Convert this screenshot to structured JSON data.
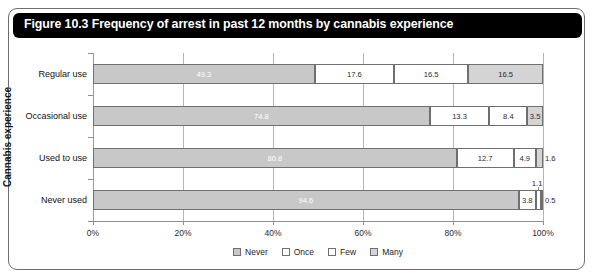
{
  "figure": {
    "title": "Figure 10.3 Frequency of arrest in past 12 months by cannabis experience"
  },
  "legend": {
    "items": [
      {
        "label": "Never",
        "color": "#c8c8c8"
      },
      {
        "label": "Once",
        "color": "#ffffff"
      },
      {
        "label": "Few",
        "color": "#ffffff"
      },
      {
        "label": "Many",
        "color": "#d4d4d4"
      }
    ]
  },
  "chart_data": {
    "type": "bar",
    "orientation": "horizontal",
    "stacked": true,
    "normalized_percent": true,
    "title": "Figure 10.3 Frequency of arrest in past 12 months by cannabis experience",
    "xlabel": "",
    "ylabel": "Cannabis experience",
    "xlim": [
      0,
      100
    ],
    "xticks": [
      0,
      20,
      40,
      60,
      80,
      100
    ],
    "xtick_labels": [
      "0%",
      "20%",
      "40%",
      "60%",
      "80%",
      "100%"
    ],
    "grid": true,
    "legend_position": "bottom",
    "categories": [
      "Regular use",
      "Occasional use",
      "Used to use",
      "Never used"
    ],
    "series": [
      {
        "name": "Never",
        "values": [
          49.3,
          74.8,
          80.8,
          94.6
        ]
      },
      {
        "name": "Once",
        "values": [
          17.6,
          13.3,
          12.7,
          3.8
        ]
      },
      {
        "name": "Few",
        "values": [
          16.5,
          8.4,
          4.9,
          1.1
        ]
      },
      {
        "name": "Many",
        "values": [
          16.5,
          3.5,
          1.6,
          0.5
        ]
      }
    ]
  },
  "bars": [
    {
      "category": "Regular use",
      "segments": [
        {
          "series": "Never",
          "value": "49.3",
          "start": 0,
          "size": 49.3,
          "style": "never",
          "label_inside": true
        },
        {
          "series": "Once",
          "value": "17.6",
          "start": 49.3,
          "size": 17.6,
          "style": "once",
          "label_inside": true
        },
        {
          "series": "Few",
          "value": "16.5",
          "start": 66.9,
          "size": 16.5,
          "style": "few",
          "label_inside": true
        },
        {
          "series": "Many",
          "value": "16.5",
          "start": 83.4,
          "size": 16.6,
          "style": "many",
          "label_inside": true
        }
      ]
    },
    {
      "category": "Occasional use",
      "segments": [
        {
          "series": "Never",
          "value": "74.8",
          "start": 0,
          "size": 74.8,
          "style": "never",
          "label_inside": true
        },
        {
          "series": "Once",
          "value": "13.3",
          "start": 74.8,
          "size": 13.3,
          "style": "once",
          "label_inside": true
        },
        {
          "series": "Few",
          "value": "8.4",
          "start": 88.1,
          "size": 8.4,
          "style": "few",
          "label_inside": true
        },
        {
          "series": "Many",
          "value": "3.5",
          "start": 96.5,
          "size": 3.5,
          "style": "many",
          "label_inside": true
        }
      ]
    },
    {
      "category": "Used to use",
      "segments": [
        {
          "series": "Never",
          "value": "80.8",
          "start": 0,
          "size": 80.8,
          "style": "never",
          "label_inside": true
        },
        {
          "series": "Once",
          "value": "12.7",
          "start": 80.8,
          "size": 12.7,
          "style": "once",
          "label_inside": true
        },
        {
          "series": "Few",
          "value": "4.9",
          "start": 93.5,
          "size": 4.9,
          "style": "few",
          "label_inside": true
        },
        {
          "series": "Many",
          "value": "1.6",
          "start": 98.4,
          "size": 1.6,
          "style": "many",
          "label_inside": false,
          "label_offset": 2
        }
      ]
    },
    {
      "category": "Never used",
      "segments": [
        {
          "series": "Never",
          "value": "94.6",
          "start": 0,
          "size": 94.6,
          "style": "never",
          "label_inside": true
        },
        {
          "series": "Once",
          "value": "3.8",
          "start": 94.6,
          "size": 3.8,
          "style": "once",
          "label_inside": true
        },
        {
          "series": "Few",
          "value": "1.1",
          "start": 98.4,
          "size": 1.1,
          "style": "few",
          "label_inside": false,
          "label_above": true
        },
        {
          "series": "Many",
          "value": "0.5",
          "start": 99.5,
          "size": 0.5,
          "style": "many",
          "label_inside": false,
          "label_offset": 2
        }
      ]
    }
  ]
}
